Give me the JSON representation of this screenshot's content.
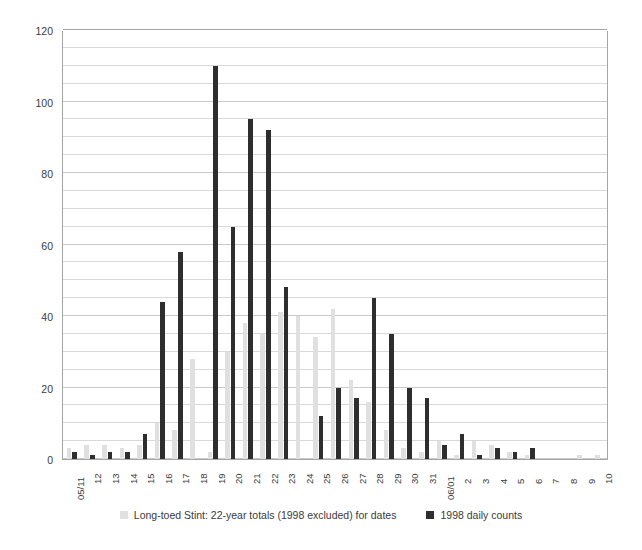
{
  "chart_data": {
    "type": "bar",
    "title": "",
    "subtitle": "",
    "xlabel": "",
    "ylabel": "",
    "ylim": [
      0,
      120
    ],
    "y_major_step": 20,
    "y_minor_step": 5,
    "grid": true,
    "legend_position": "bottom",
    "y_ticks": [
      0,
      20,
      40,
      60,
      80,
      100,
      120
    ],
    "categories": [
      "05/11",
      "12",
      "13",
      "14",
      "15",
      "16",
      "17",
      "18",
      "19",
      "20",
      "21",
      "22",
      "23",
      "24",
      "25",
      "26",
      "27",
      "28",
      "29",
      "30",
      "31",
      "06/01",
      "2",
      "3",
      "4",
      "5",
      "6",
      "7",
      "8",
      "9",
      "10"
    ],
    "series": [
      {
        "name": "Long-toed Stint: 22-year totals (1998 excluded) for dates",
        "color": "#e0e0e0",
        "values": [
          3,
          4,
          4,
          3,
          4,
          10,
          8,
          28,
          2,
          30,
          38,
          35,
          41,
          40,
          34,
          42,
          22,
          16,
          8,
          3,
          2,
          5,
          1,
          5,
          4,
          2,
          1,
          0,
          0,
          1,
          1
        ]
      },
      {
        "name": "1998 daily counts",
        "color": "#2e2e2e",
        "values": [
          2,
          1,
          2,
          2,
          7,
          44,
          58,
          0,
          110,
          65,
          95,
          92,
          48,
          0,
          12,
          20,
          17,
          45,
          35,
          20,
          17,
          4,
          7,
          1,
          3,
          2,
          3,
          0,
          0,
          0,
          0
        ]
      }
    ]
  },
  "legend": {
    "items": [
      {
        "label": "Long-toed Stint: 22-year totals (1998 excluded) for dates",
        "swatch": "gray"
      },
      {
        "label": "1998 daily counts",
        "swatch": "black"
      }
    ]
  },
  "colors": {
    "series_gray": "#e0e0e0",
    "series_black": "#2e2e2e",
    "gridline": "#d9d9d9",
    "axis": "#a6a6a6",
    "text": "#3b3b3b",
    "background": "#ffffff"
  }
}
